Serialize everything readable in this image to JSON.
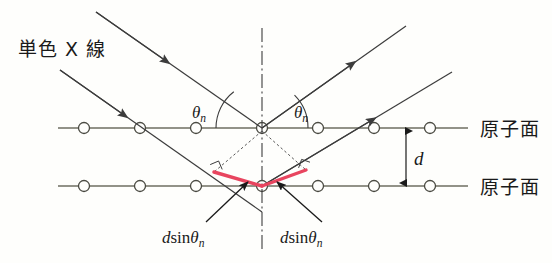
{
  "figure": {
    "background_color": "#fefefc"
  },
  "colors": {
    "ray": "#3c3c3c",
    "plane_line": "#6e6e62",
    "atom_stroke": "#4a4a42",
    "atom_fill": "#fefefc",
    "path_difference": "#e8455f",
    "axis": "#3c3c3c",
    "text": "#1a1a1a",
    "construction": "#555555"
  },
  "labels": {
    "incident_beam": "単色 X 線",
    "plane_upper": "原子面",
    "plane_lower": "原子面",
    "theta_left": "θ",
    "theta_left_sub": "n",
    "theta_right": "θ",
    "theta_right_sub": "n",
    "spacing": "d",
    "path_left_d": "d",
    "path_left_sin": "sin",
    "path_left_theta": "θ",
    "path_left_sub": "n",
    "path_right_d": "d",
    "path_right_sin": "sin",
    "path_right_theta": "θ",
    "path_right_sub": "n"
  },
  "geometry": {
    "plane_upper_y": 128,
    "plane_lower_y": 186,
    "plane_x_start": 58,
    "plane_x_end": 468,
    "atom_radius": 5.5,
    "atom_positions_upper": [
      84,
      140,
      196,
      262,
      318,
      374,
      430
    ],
    "atom_positions_lower": [
      84,
      140,
      196,
      262,
      318,
      374,
      430
    ],
    "vertex_upper": {
      "x": 262,
      "y": 128
    },
    "vertex_lower": {
      "x": 262,
      "y": 186
    },
    "normal_axis_top_y": 28,
    "normal_axis_bottom_y": 252,
    "incident_ray_upper": {
      "x1": 96,
      "y1": 12,
      "x2": 262,
      "y2": 128
    },
    "incident_ray_lower": {
      "x1": 60,
      "y1": 70,
      "x2": 262,
      "y2": 212
    },
    "outgoing_ray_upper": {
      "x1": 262,
      "y1": 128,
      "x2": 406,
      "y2": 26
    },
    "outgoing_ray_lower": {
      "x1": 262,
      "y1": 186,
      "x2": 452,
      "y2": 72
    },
    "red_segment_left": {
      "x1": 214,
      "y1": 172,
      "x2": 262,
      "y2": 186
    },
    "red_segment_right": {
      "x1": 262,
      "y1": 186,
      "x2": 306,
      "y2": 170
    },
    "dotted_left": {
      "x1": 262,
      "y1": 130,
      "x2": 214,
      "y2": 172
    },
    "dotted_right": {
      "x1": 262,
      "y1": 130,
      "x2": 306,
      "y2": 170
    },
    "dimension_x": 406,
    "arc_radius_left": 46,
    "arc_radius_right": 46
  },
  "annotations": {
    "theta_left_pos": {
      "x": 196,
      "y": 116
    },
    "theta_right_pos": {
      "x": 296,
      "y": 116
    },
    "spacing_pos": {
      "x": 414,
      "y": 164
    },
    "path_left_pos": {
      "x": 168,
      "y": 242
    },
    "path_right_pos": {
      "x": 284,
      "y": 242
    },
    "incident_label_pos": {
      "x": 18,
      "y": 56
    },
    "plane_upper_label_pos": {
      "x": 480,
      "y": 136
    },
    "plane_lower_label_pos": {
      "x": 480,
      "y": 194
    },
    "leader_left": {
      "x1": 206,
      "y1": 222,
      "x2": 246,
      "y2": 183
    },
    "leader_right": {
      "x1": 322,
      "y1": 222,
      "x2": 278,
      "y2": 183
    }
  }
}
